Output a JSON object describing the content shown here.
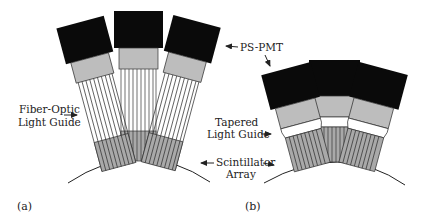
{
  "figure": {
    "panels": [
      {
        "id": "a",
        "label": "(a)"
      },
      {
        "id": "b",
        "label": "(b)"
      }
    ],
    "labels": {
      "fiber_optic": [
        "Fiber-Optic",
        "Light Guide"
      ],
      "ps_pmt": "PS-PMT",
      "tapered": [
        "Tapered",
        "Light Guide"
      ],
      "scintillator": [
        "Scintillator",
        "Array"
      ]
    },
    "colors": {
      "pmt": "#0a0a0a",
      "base": "#bdbdbd",
      "scintillator": "#a9a9a9",
      "lines": "#333333",
      "background": "#ffffff"
    }
  }
}
